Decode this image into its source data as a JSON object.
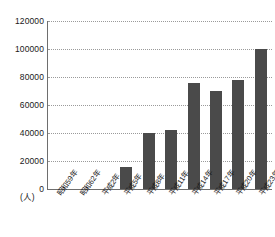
{
  "chart_data": {
    "type": "bar",
    "title": "",
    "subtitle": "",
    "xlabel": "",
    "ylabel": "",
    "unit_label": "(人)",
    "categories": [
      "昭和59年",
      "昭和62年",
      "平成2年",
      "平成5年",
      "平成8年",
      "平成11年",
      "平成14年",
      "平成17年",
      "平成20年",
      "平成23年"
    ],
    "values": [
      0,
      0,
      0,
      16000,
      40000,
      42000,
      76000,
      70000,
      78000,
      100000
    ],
    "ylim": [
      0,
      120000
    ],
    "ytick_labels": [
      "0",
      "20000",
      "40000",
      "60000",
      "80000",
      "100000",
      "120000"
    ],
    "ytick_values": [
      0,
      20000,
      40000,
      60000,
      80000,
      100000,
      120000
    ],
    "grid": true,
    "legend": false,
    "series_color": "#4a4a4a",
    "axis_color": "#6e6e6e",
    "gridline_color": "#9a9a9a"
  }
}
